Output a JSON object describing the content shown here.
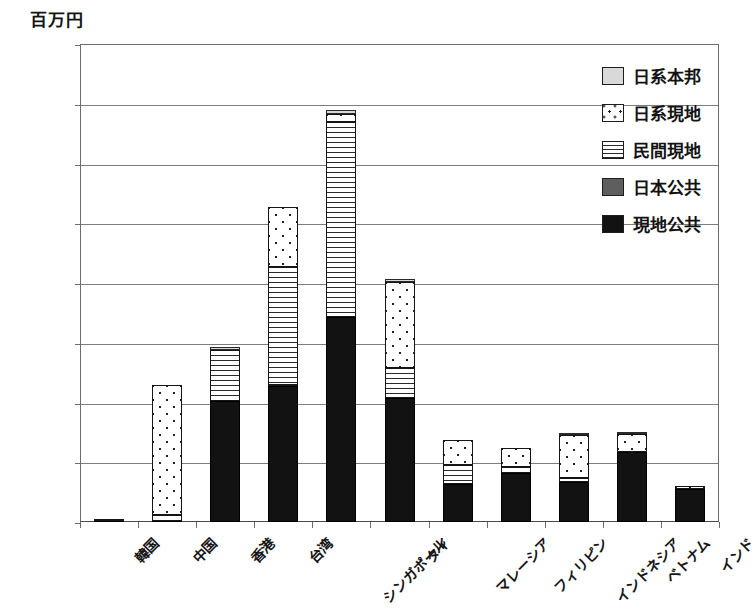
{
  "unit_title": "百万円",
  "legend": {
    "items": [
      {
        "label": "日系本邦",
        "key": "nikkei_honpou",
        "swatch": "light-gray-solid"
      },
      {
        "label": "日系現地",
        "key": "nikkei_genchi",
        "swatch": "dotted"
      },
      {
        "label": "民間現地",
        "key": "minkan_genchi",
        "swatch": "horizontal-lines"
      },
      {
        "label": "日本公共",
        "key": "nihon_koukyou",
        "swatch": "dark-gray-solid"
      },
      {
        "label": "現地公共",
        "key": "genchi_koukyou",
        "swatch": "black-solid"
      }
    ]
  },
  "chart_data": {
    "type": "bar",
    "stacked": true,
    "title": "",
    "xlabel": "",
    "ylabel": "百万円",
    "ylim": [
      0,
      160000
    ],
    "ytick_step": 20000,
    "ytick_labels": [
      "0",
      "20,000",
      "40,000",
      "60,000",
      "80,000",
      "100,000",
      "120,000",
      "140,000",
      "160,000"
    ],
    "grid": true,
    "legend_position": "right-top",
    "categories": [
      "韓国",
      "中国",
      "香港",
      "台湾",
      "シンガポール",
      "タイ",
      "マレーシア",
      "フィリピン",
      "インドネシア",
      "ベトナム",
      "インド"
    ],
    "series": [
      {
        "name": "現地公共",
        "values": [
          300,
          400,
          40500,
          45500,
          68500,
          41500,
          12800,
          16500,
          13400,
          23500,
          11000
        ]
      },
      {
        "name": "日本公共",
        "values": [
          0,
          0,
          0,
          400,
          0,
          0,
          0,
          0,
          0,
          0,
          0
        ]
      },
      {
        "name": "民間現地",
        "values": [
          200,
          1900,
          17000,
          39600,
          65500,
          10200,
          6400,
          1900,
          1400,
          0,
          0
        ]
      },
      {
        "name": "日系現地",
        "values": [
          0,
          43700,
          0,
          19800,
          2700,
          28800,
          8300,
          6400,
          14300,
          5900,
          1000
        ]
      },
      {
        "name": "日系本邦",
        "values": [
          0,
          0,
          1000,
          0,
          1100,
          900,
          0,
          0,
          400,
          400,
          0
        ]
      }
    ],
    "totals": [
      500,
      46000,
      58500,
      105300,
      137800,
      81400,
      27500,
      24800,
      29500,
      29800,
      12000
    ]
  }
}
